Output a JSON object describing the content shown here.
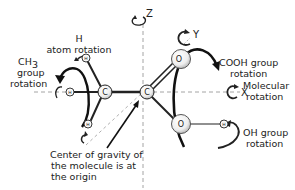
{
  "diagram": {
    "axes": {
      "z": "Z",
      "y": "Y",
      "x": "X"
    },
    "atoms": {
      "carbon_left": "C",
      "carbon_right": "C",
      "oxygen_double": "O",
      "oxygen_hydroxyl": "O",
      "hydrogen": "H"
    },
    "labels": {
      "h_rotation_line1": "H",
      "h_rotation_line2": "atom rotation",
      "ch3_line1": "CH",
      "ch3_sub": "3",
      "ch3_line2": "group",
      "ch3_line3": "rotation",
      "cooh_line1": "COOH group",
      "cooh_line2": "rotation",
      "molecular_line1": "Molecular",
      "molecular_line2": "rotation",
      "oh_line1": "OH group",
      "oh_line2": "rotation",
      "cog_line1": "Center of gravity of",
      "cog_line2": "the molecule is at",
      "cog_line3": "the origin"
    },
    "colors": {
      "ink": "#222222",
      "dashed_axis": "#9a9a9a",
      "atom_fill": "#f4f4f4",
      "atom_shade": "#cfcfcf"
    }
  }
}
